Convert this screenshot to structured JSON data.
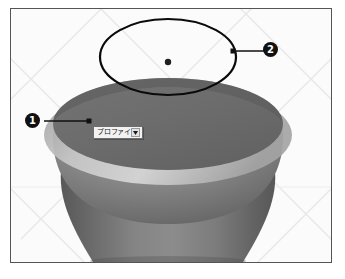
{
  "figure": {
    "name": "cad-revolved-solid-figure",
    "background_color": "#fbfbfb",
    "border_color": "#555555"
  },
  "viewport": {
    "grid_color": "#e9e9e9",
    "grid_label": "perspective-grid"
  },
  "model": {
    "name": "revolved-solid",
    "top_face_color": "#6b6b6b",
    "rim_highlight_color": "#cfcfcf",
    "body_color": "#7b7b7b",
    "shadow_color": "#4f4f4f"
  },
  "sketch": {
    "name": "sketch-ellipse",
    "stroke_color": "#0a0a0a",
    "center_point_color": "#1a1a1a",
    "center_point_label": "sketch-center-point"
  },
  "dropdown": {
    "label": "プロファイ...",
    "arrow_icon": "chevron-down-icon",
    "border_color": "#6e6e6e",
    "background_color": "#f2f2f2"
  },
  "callouts": [
    {
      "id": "callout-1",
      "number": "❶",
      "text": "1",
      "leader_from": [
        42,
        120
      ],
      "leader_to": [
        88,
        120
      ],
      "target_point_label": "profile-selection-point"
    },
    {
      "id": "callout-2",
      "number": "❷",
      "text": "2",
      "leader_from": [
        232,
        50
      ],
      "leader_to": [
        265,
        50
      ],
      "target_point_label": "sketch-ellipse-edge-point"
    }
  ]
}
